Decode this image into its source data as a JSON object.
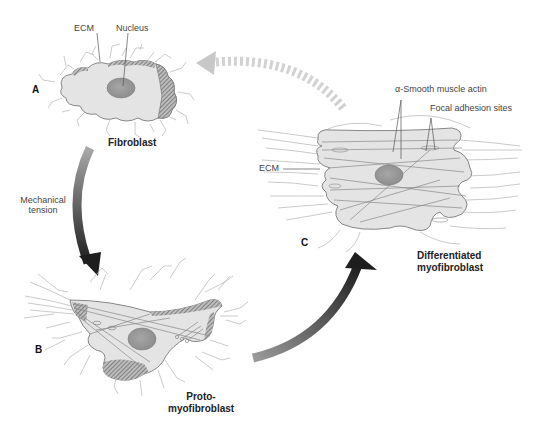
{
  "figure": {
    "colors": {
      "cell_fill": "#e4e4e4",
      "cell_outline": "#7a7a7a",
      "nucleus": "#9a9a9a",
      "ecm_fibers": "#b8b8b8",
      "hatch": "#6e6e6e",
      "arrow_dark": "#1e1e1e",
      "arrow_light": "#9c9c9c",
      "return_arrow": "#d0d0d0"
    }
  },
  "panels": {
    "a": {
      "letter": "A",
      "name": "Fibroblast",
      "labels": {
        "ecm": "ECM",
        "nucleus": "Nucleus"
      }
    },
    "b": {
      "letter": "B",
      "name_line1": "Proto-",
      "name_line2": "myofibroblast"
    },
    "c": {
      "letter": "C",
      "name_line1": "Differentiated",
      "name_line2": "myofibroblast",
      "labels": {
        "ecm": "ECM",
        "actin": "α-Smooth muscle actin",
        "focal": "Focal adhesion sites"
      }
    }
  },
  "arrows": {
    "a_to_b": {
      "label_line1": "Mechanical",
      "label_line2": "tension"
    },
    "b_to_c": {
      "label": ""
    },
    "c_to_a": {
      "style": "dashed"
    }
  }
}
